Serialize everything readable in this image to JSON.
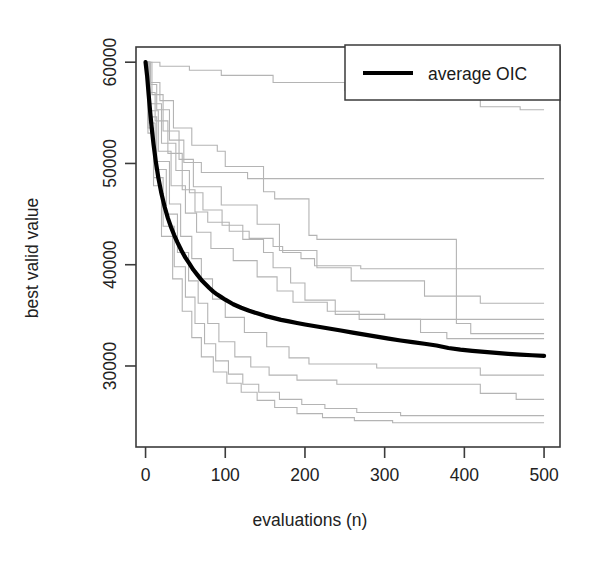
{
  "chart_data": {
    "type": "line",
    "title": "",
    "subtitle": "",
    "xlabel": "evaluations (n)",
    "ylabel": "best valid value",
    "xlim": [
      -12,
      520
    ],
    "ylim": [
      22000,
      61500
    ],
    "xticks": [
      0,
      100,
      200,
      300,
      400,
      500
    ],
    "xtick_labels": [
      "0",
      "100",
      "200",
      "300",
      "400",
      "500"
    ],
    "yticks": [
      30000,
      40000,
      50000,
      60000
    ],
    "ytick_labels": [
      "30000",
      "40000",
      "50000",
      "60000"
    ],
    "grid": false,
    "legend_position": "top-right",
    "legend": [
      {
        "name": "average OIC",
        "color": "#000000",
        "width": 4.2
      }
    ],
    "colors": {
      "average": "#000000",
      "runs": "#b4b4b4",
      "axis": "#3b3b3b",
      "background": "#ffffff"
    },
    "series": [
      {
        "name": "average OIC",
        "role": "average",
        "color": "#000000",
        "x": [
          0,
          2,
          4,
          6,
          8,
          10,
          13,
          16,
          20,
          24,
          28,
          32,
          36,
          40,
          45,
          50,
          55,
          60,
          65,
          70,
          75,
          80,
          85,
          90,
          95,
          100,
          110,
          120,
          130,
          140,
          150,
          160,
          170,
          180,
          190,
          200,
          215,
          230,
          245,
          260,
          275,
          290,
          305,
          320,
          335,
          350,
          365,
          380,
          395,
          410,
          425,
          440,
          455,
          470,
          485,
          500
        ],
        "y": [
          60000,
          58600,
          56700,
          54900,
          53300,
          51900,
          50100,
          48600,
          47000,
          45700,
          44600,
          43700,
          42900,
          42200,
          41400,
          40700,
          40100,
          39500,
          39000,
          38500,
          38100,
          37700,
          37350,
          37050,
          36800,
          36550,
          36100,
          35750,
          35450,
          35200,
          34950,
          34750,
          34550,
          34400,
          34250,
          34100,
          33900,
          33700,
          33500,
          33300,
          33100,
          32900,
          32700,
          32520,
          32360,
          32200,
          32020,
          31780,
          31620,
          31500,
          31400,
          31300,
          31200,
          31120,
          31060,
          31000
        ]
      },
      {
        "name": "run-1",
        "role": "run",
        "color": "#b4b4b4",
        "x": [
          0,
          18,
          18,
          55,
          55,
          95,
          95,
          160,
          160,
          250,
          250,
          340,
          340,
          420,
          420,
          470,
          470,
          500
        ],
        "y": [
          60000,
          60000,
          59600,
          59600,
          59200,
          59200,
          58700,
          58700,
          58000,
          58000,
          57200,
          57200,
          56300,
          56300,
          55600,
          55600,
          55300,
          55300
        ]
      },
      {
        "name": "run-2",
        "role": "run",
        "color": "#b4b4b4",
        "x": [
          0,
          6,
          6,
          14,
          14,
          30,
          30,
          48,
          48,
          70,
          70,
          128,
          128,
          500
        ],
        "y": [
          60000,
          60000,
          57800,
          57800,
          55300,
          55300,
          52300,
          52300,
          50100,
          50100,
          49100,
          49100,
          48500,
          48500
        ]
      },
      {
        "name": "run-3",
        "role": "run",
        "color": "#b4b4b4",
        "x": [
          0,
          5,
          5,
          18,
          18,
          35,
          35,
          58,
          58,
          90,
          90,
          100,
          100,
          148,
          148,
          162,
          162,
          205,
          205,
          215,
          215,
          390,
          390,
          408,
          408,
          500
        ],
        "y": [
          60000,
          60000,
          58000,
          58000,
          56200,
          56200,
          53500,
          53500,
          51800,
          51800,
          51200,
          51200,
          49700,
          49700,
          47200,
          47200,
          46500,
          46500,
          42900,
          42900,
          42500,
          42500,
          34200,
          34200,
          33200,
          33200
        ]
      },
      {
        "name": "run-4",
        "role": "run",
        "color": "#b4b4b4",
        "x": [
          0,
          8,
          8,
          22,
          22,
          42,
          42,
          60,
          60,
          95,
          95,
          140,
          140,
          168,
          168,
          215,
          215,
          258,
          258,
          350,
          350,
          420,
          420,
          500
        ],
        "y": [
          60000,
          60000,
          56800,
          56800,
          53200,
          53200,
          50400,
          50400,
          47700,
          47700,
          45900,
          45900,
          44000,
          44000,
          41400,
          41400,
          39700,
          39700,
          38400,
          38400,
          36900,
          36900,
          36200,
          36200
        ]
      },
      {
        "name": "run-5",
        "role": "run",
        "color": "#b4b4b4",
        "x": [
          0,
          4,
          4,
          12,
          12,
          28,
          28,
          46,
          46,
          62,
          62,
          78,
          78,
          105,
          105,
          130,
          130,
          160,
          160,
          172,
          172,
          195,
          195,
          212,
          212,
          270,
          270,
          500
        ],
        "y": [
          60000,
          60000,
          57000,
          57000,
          54200,
          54200,
          51000,
          51000,
          47400,
          47400,
          45200,
          45200,
          44200,
          44200,
          43300,
          43300,
          42600,
          42600,
          41800,
          41800,
          41200,
          41200,
          40600,
          40600,
          39900,
          39900,
          39600,
          39600
        ]
      },
      {
        "name": "run-6",
        "role": "run",
        "color": "#b4b4b4",
        "x": [
          0,
          6,
          6,
          20,
          20,
          38,
          38,
          55,
          55,
          72,
          72,
          96,
          96,
          122,
          122,
          148,
          148,
          160,
          160,
          182,
          182,
          200,
          200,
          238,
          238,
          300,
          300,
          500
        ],
        "y": [
          60000,
          60000,
          55900,
          55900,
          52000,
          52000,
          49300,
          49300,
          47100,
          47100,
          45400,
          45400,
          43900,
          43900,
          42500,
          42500,
          41200,
          41200,
          39700,
          39700,
          38200,
          38200,
          36500,
          36500,
          35100,
          35100,
          34600,
          34600
        ]
      },
      {
        "name": "run-7",
        "role": "run",
        "color": "#b4b4b4",
        "x": [
          0,
          5,
          5,
          16,
          16,
          32,
          32,
          50,
          50,
          64,
          64,
          82,
          82,
          110,
          110,
          140,
          140,
          165,
          165,
          185,
          185,
          228,
          228,
          268,
          268,
          345,
          345,
          378,
          378,
          500
        ],
        "y": [
          60000,
          60000,
          55200,
          55200,
          51200,
          51200,
          47800,
          47800,
          45100,
          45100,
          43200,
          43200,
          41600,
          41600,
          40400,
          40400,
          38800,
          38800,
          37400,
          37400,
          36300,
          36300,
          35400,
          35400,
          34600,
          34600,
          33300,
          33300,
          32700,
          32700
        ]
      },
      {
        "name": "run-8",
        "role": "run",
        "color": "#b4b4b4",
        "x": [
          0,
          4,
          4,
          14,
          14,
          30,
          30,
          44,
          44,
          58,
          58,
          70,
          70,
          84,
          84,
          100,
          100,
          124,
          124,
          152,
          152,
          180,
          180,
          205,
          205,
          290,
          290,
          420,
          420,
          500
        ],
        "y": [
          60000,
          60000,
          54600,
          54600,
          50200,
          50200,
          46000,
          46000,
          42800,
          42800,
          40600,
          40600,
          38600,
          38600,
          36600,
          36600,
          34800,
          34800,
          33300,
          33300,
          31900,
          31900,
          30800,
          30800,
          30200,
          30200,
          29800,
          29800,
          29100,
          29100
        ]
      },
      {
        "name": "run-9",
        "role": "run",
        "color": "#b4b4b4",
        "x": [
          0,
          4,
          4,
          12,
          12,
          26,
          26,
          40,
          40,
          54,
          54,
          66,
          66,
          78,
          78,
          92,
          92,
          112,
          112,
          132,
          132,
          155,
          155,
          190,
          190,
          240,
          240,
          420,
          420,
          465,
          465,
          500
        ],
        "y": [
          60000,
          60000,
          54000,
          54000,
          49400,
          49400,
          45000,
          45000,
          41200,
          41200,
          38400,
          38400,
          36200,
          36200,
          34200,
          34200,
          32400,
          32400,
          30900,
          30900,
          29900,
          29900,
          29100,
          29100,
          28600,
          28600,
          28200,
          28200,
          27300,
          27300,
          26700,
          26700
        ]
      },
      {
        "name": "run-10",
        "role": "run",
        "color": "#b4b4b4",
        "x": [
          0,
          3,
          3,
          10,
          10,
          22,
          22,
          36,
          36,
          50,
          50,
          62,
          62,
          74,
          74,
          88,
          88,
          104,
          104,
          122,
          122,
          142,
          142,
          168,
          168,
          196,
          196,
          225,
          225,
          265,
          265,
          320,
          320,
          500
        ],
        "y": [
          60000,
          60000,
          53500,
          53500,
          48600,
          48600,
          43800,
          43800,
          39800,
          39800,
          36800,
          36800,
          34200,
          34200,
          32200,
          32200,
          30500,
          30500,
          29200,
          29200,
          28200,
          28200,
          27400,
          27400,
          26700,
          26700,
          26200,
          26200,
          25800,
          25800,
          25400,
          25400,
          25100,
          25100
        ]
      },
      {
        "name": "run-11",
        "role": "run",
        "color": "#b4b4b4",
        "x": [
          0,
          3,
          3,
          10,
          10,
          20,
          20,
          34,
          34,
          46,
          46,
          58,
          58,
          70,
          70,
          85,
          85,
          102,
          102,
          120,
          120,
          140,
          140,
          162,
          162,
          190,
          190,
          222,
          222,
          262,
          262,
          310,
          310,
          500
        ],
        "y": [
          60000,
          60000,
          53000,
          53000,
          47800,
          47800,
          42800,
          42800,
          38600,
          38600,
          35400,
          35400,
          32800,
          32800,
          30900,
          30900,
          29400,
          29400,
          28300,
          28300,
          27400,
          27400,
          26600,
          26600,
          25900,
          25900,
          25300,
          25300,
          24900,
          24900,
          24600,
          24600,
          24400,
          24400
        ]
      }
    ]
  },
  "legend": {
    "label": "average OIC"
  },
  "axes": {
    "x_title": "evaluations (n)",
    "y_title": "best valid value"
  }
}
